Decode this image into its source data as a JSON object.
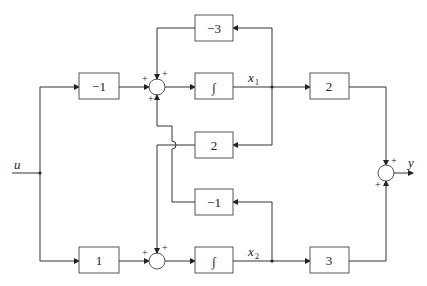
{
  "diagram": {
    "type": "block-diagram",
    "input_label": "u",
    "output_label": "y",
    "state_labels": {
      "x1": "x",
      "x1_sub": "1",
      "x2": "x",
      "x2_sub": "2"
    },
    "blocks": {
      "gain_in_top": "−1",
      "gain_in_bottom": "1",
      "integrator_top": "∫",
      "integrator_bottom": "∫",
      "feedback_neg3": "−3",
      "feedback_2": "2",
      "feedback_neg1": "−1",
      "output_gain_top": "2",
      "output_gain_bottom": "3"
    },
    "sum_signs": {
      "sum1_left": "+",
      "sum1_top": "+",
      "sum1_bottom": "+",
      "sum2_left": "+",
      "sum2_top": "+",
      "sum_out_top": "+",
      "sum_out_bottom": "+"
    }
  }
}
